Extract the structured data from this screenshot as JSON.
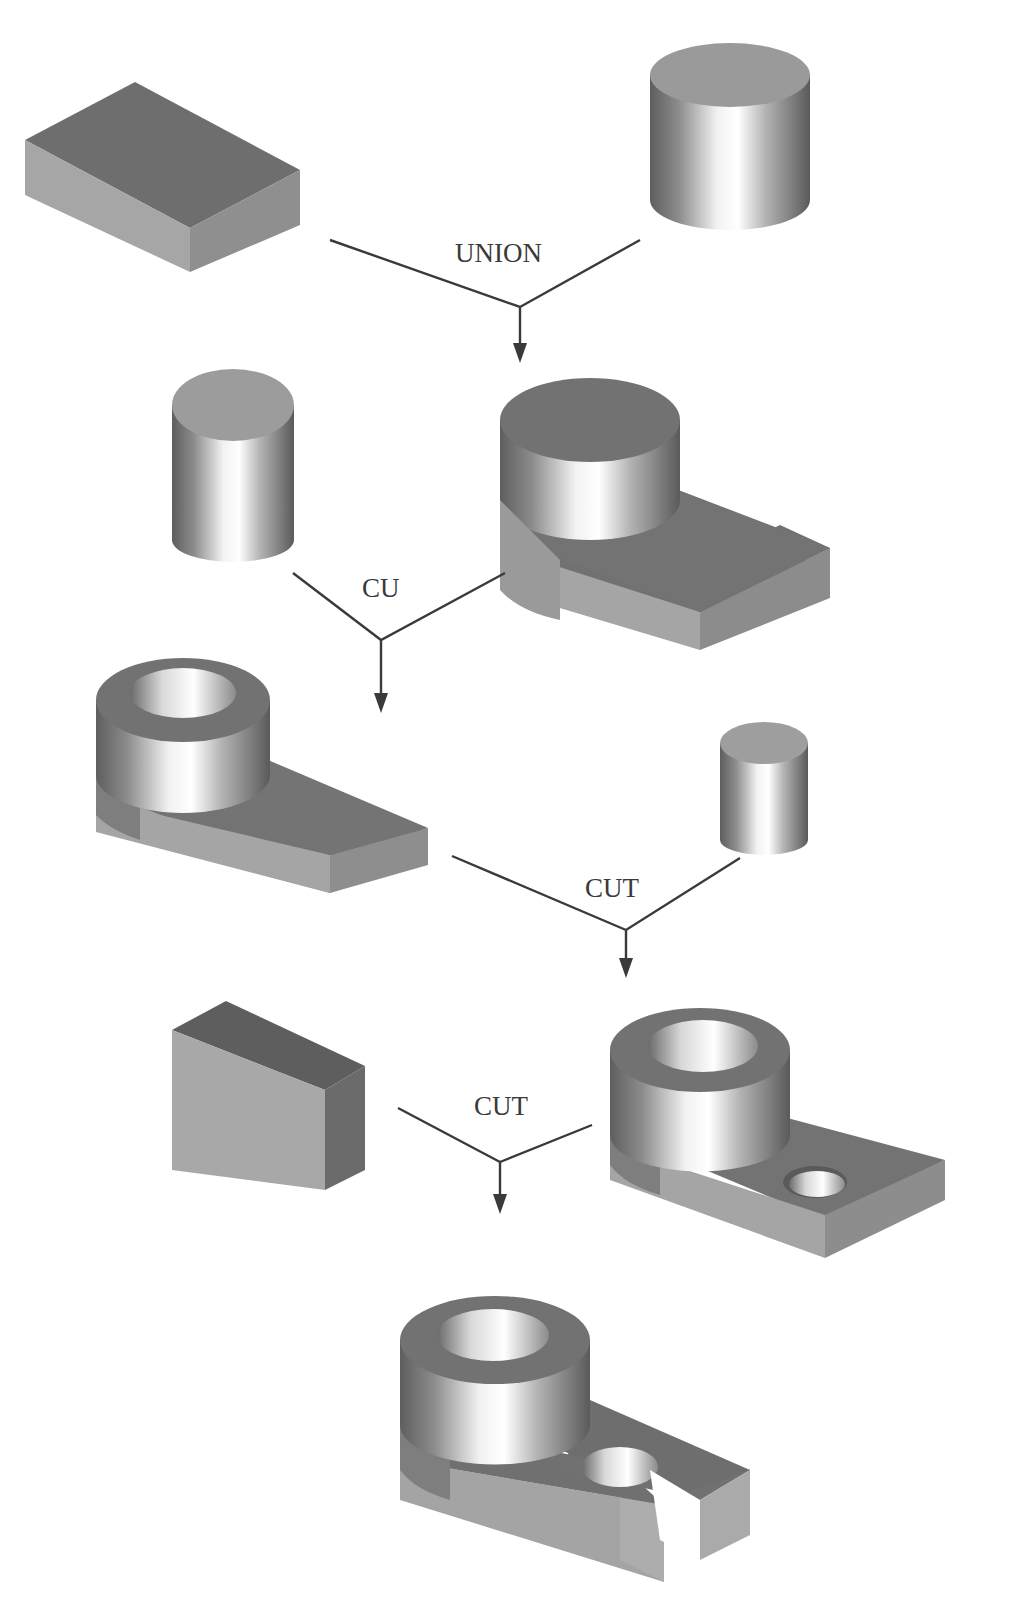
{
  "diagram": {
    "colors": {
      "background": "#ffffff",
      "top_dark": "#6f6f6f",
      "top_mid": "#8a8a8a",
      "side_light": "#a8a8a8",
      "side_dark": "#787878",
      "line": "#3a3a3a"
    },
    "operations": [
      {
        "id": "op1",
        "label": "UNION",
        "left": [
          330,
          240
        ],
        "right": [
          640,
          240
        ],
        "junction": [
          520,
          307
        ],
        "arrow_end": [
          520,
          362
        ],
        "label_pos": [
          455,
          262
        ]
      },
      {
        "id": "op2",
        "label": "CU",
        "left": [
          293,
          573
        ],
        "right": [
          505,
          573
        ],
        "junction": [
          381,
          640
        ],
        "arrow_end": [
          381,
          712
        ],
        "label_pos": [
          362,
          597
        ]
      },
      {
        "id": "op3",
        "label": "CUT",
        "left": [
          452,
          856
        ],
        "right": [
          740,
          858
        ],
        "junction": [
          626,
          930
        ],
        "arrow_end": [
          626,
          978
        ],
        "label_pos": [
          585,
          897
        ]
      },
      {
        "id": "op4",
        "label": "CUT",
        "left": [
          398,
          1108
        ],
        "right": [
          608,
          1124
        ],
        "junction": [
          500,
          1162
        ],
        "arrow_end": [
          500,
          1213
        ],
        "label_pos": [
          474,
          1115
        ]
      }
    ],
    "shapes": [
      {
        "id": "box-1",
        "kind": "box",
        "name": "Rectangular block"
      },
      {
        "id": "cylinder-1",
        "kind": "cylinder",
        "name": "Large cylinder"
      },
      {
        "id": "cylinder-2",
        "kind": "cylinder",
        "name": "Cylinder (hole tool)"
      },
      {
        "id": "union-result",
        "kind": "union",
        "name": "Block + cylinder union"
      },
      {
        "id": "bored-part",
        "kind": "composite",
        "name": "Part with bored boss"
      },
      {
        "id": "cylinder-3",
        "kind": "cylinder",
        "name": "Small cylinder (hole tool)"
      },
      {
        "id": "holed-part",
        "kind": "composite",
        "name": "Part with through hole"
      },
      {
        "id": "box-2",
        "kind": "box",
        "name": "Slot cutting block"
      },
      {
        "id": "final-part",
        "kind": "composite",
        "name": "Final slotted part"
      }
    ]
  }
}
